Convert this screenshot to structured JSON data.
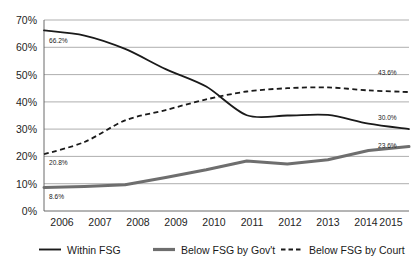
{
  "chart_data": {
    "type": "line",
    "title": "",
    "subtitle": "",
    "xlabel": "",
    "ylabel": "",
    "x": [
      2006,
      2007,
      2008,
      2009,
      2010,
      2011,
      2012,
      2013,
      2014,
      2015
    ],
    "categories": [
      "2006",
      "2007",
      "2008",
      "2009",
      "2010",
      "2011",
      "2012",
      "2013",
      "2014",
      "2015"
    ],
    "ylim": [
      0,
      70
    ],
    "yticks": [
      0,
      10,
      20,
      30,
      40,
      50,
      60,
      70
    ],
    "ytick_labels": [
      "0%",
      "10%",
      "20%",
      "30%",
      "40%",
      "50%",
      "60%",
      "70%"
    ],
    "grid": "horizontal",
    "legend_position": "bottom",
    "series": [
      {
        "name": "Within FSG",
        "style": "solid",
        "color": "#1a1a1a",
        "width": 1.8,
        "values": [
          66.2,
          64.3,
          59.4,
          52.0,
          45.6,
          35.1,
          35.0,
          35.2,
          32.0,
          30.0
        ]
      },
      {
        "name": "Below FSG by Gov't",
        "style": "solid",
        "color": "#6e6e6e",
        "width": 3.0,
        "values": [
          8.6,
          9.0,
          9.6,
          12.3,
          15.1,
          18.3,
          17.2,
          18.8,
          22.2,
          23.6
        ]
      },
      {
        "name": "Below FSG by Court",
        "style": "dashed",
        "color": "#1a1a1a",
        "width": 1.8,
        "values": [
          20.8,
          25.3,
          33.2,
          37.0,
          40.9,
          43.8,
          45.0,
          45.3,
          44.2,
          43.6
        ]
      }
    ],
    "point_labels": [
      {
        "series": "Within FSG",
        "x": 2006,
        "value": 66.2,
        "text": "66.2%",
        "anchor": "below-right"
      },
      {
        "series": "Within FSG",
        "x": 2015,
        "value": 30.0,
        "text": "30.0%",
        "anchor": "above-right"
      },
      {
        "series": "Below FSG by Gov't",
        "x": 2006,
        "value": 8.6,
        "text": "8.6%",
        "anchor": "below-right"
      },
      {
        "series": "Below FSG by Gov't",
        "x": 2015,
        "value": 23.6,
        "text": "23.6%",
        "anchor": "above-right"
      },
      {
        "series": "Below FSG by Court",
        "x": 2006,
        "value": 20.8,
        "text": "20.8%",
        "anchor": "below-right"
      },
      {
        "series": "Below FSG by Court",
        "x": 2015,
        "value": 43.6,
        "text": "43.6%",
        "anchor": "above-right"
      }
    ]
  },
  "axis": {
    "ytick_0": "0%",
    "ytick_1": "10%",
    "ytick_2": "20%",
    "ytick_3": "30%",
    "ytick_4": "40%",
    "ytick_5": "50%",
    "ytick_6": "60%",
    "ytick_7": "70%",
    "xtick_0": "2006",
    "xtick_1": "2007",
    "xtick_2": "2008",
    "xtick_3": "2009",
    "xtick_4": "2010",
    "xtick_5": "2011",
    "xtick_6": "2012",
    "xtick_7": "2013",
    "xtick_8": "2014",
    "xtick_9": "2015"
  },
  "labels": {
    "within_start": "66.2%",
    "within_end": "30.0%",
    "gov_start": "8.6%",
    "gov_end": "23.6%",
    "court_start": "20.8%",
    "court_end": "43.6%"
  },
  "legend": {
    "items": [
      {
        "label": "Within FSG",
        "style": "solid",
        "color": "#1a1a1a"
      },
      {
        "label": "Below FSG by Gov't",
        "style": "solid-thick",
        "color": "#6e6e6e"
      },
      {
        "label": "Below FSG by Court",
        "style": "dashed",
        "color": "#1a1a1a"
      }
    ],
    "item_0": "Within FSG",
    "item_1": "Below FSG by Gov't",
    "item_2": "Below FSG by Court"
  },
  "colors": {
    "background": "#ffffff",
    "grid": "#8c8c8c",
    "axis": "#5a5a5a",
    "series_within": "#1a1a1a",
    "series_gov": "#6e6e6e",
    "series_court": "#1a1a1a"
  }
}
